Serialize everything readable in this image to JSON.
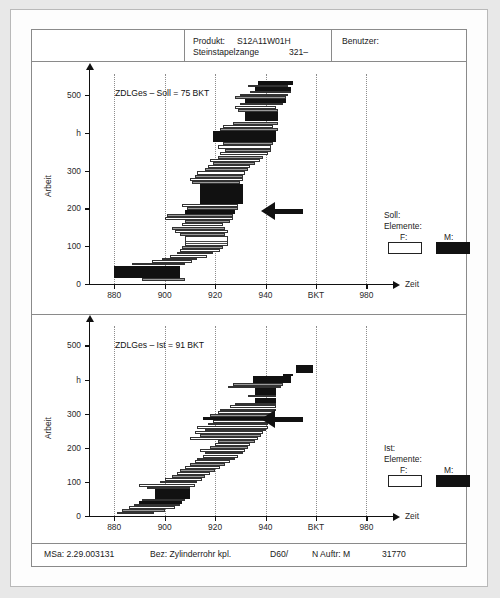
{
  "header": {
    "produkt_label": "Produkt:",
    "produkt_value": "S12A11W01H",
    "produkt_name": "Steinstapelzange",
    "produkt_num": "321–",
    "benutzer_label": "Benutzer:"
  },
  "footer": {
    "msa": "MSa: 2.29.003131",
    "bez": "Bez: Zylinderrohr kpl.",
    "d60": "D60/",
    "nauftr": "N Auftr: M",
    "number": "31770"
  },
  "legend_top": {
    "title": "Soll:",
    "subtitle": "Elemente:",
    "f_label": "F:",
    "m_label": "M:"
  },
  "legend_bottom": {
    "title": "Ist:",
    "subtitle": "Elemente:",
    "f_label": "F:",
    "m_label": "M:"
  },
  "colors": {
    "ink": "#111111",
    "grid": "#8d8d8d",
    "paper": "#ffffff",
    "page_bg": "#e8e8e8"
  },
  "chart_data": [
    {
      "id": "soll",
      "type": "bar",
      "orientation": "horizontal",
      "title": "ZDLGes – Soll = 75 BKT",
      "xlabel": "Zeit",
      "ylabel": "Arbeit",
      "yunit": "h",
      "xlim": [
        870,
        985
      ],
      "ylim": [
        0,
        545
      ],
      "xticks": [
        880,
        900,
        920,
        940,
        960,
        980
      ],
      "xticklabels": [
        "880",
        "900",
        "920",
        "940",
        "BKT",
        "980"
      ],
      "yticks": [
        0,
        100,
        200,
        300,
        400,
        500
      ],
      "yticklabels": [
        "0",
        "100",
        "200",
        "300",
        "h",
        "500"
      ],
      "grid": "vertical-dotted",
      "legend_position": "right-lower",
      "annotation_arrow_y": 193,
      "bars": [
        {
          "y": 8,
          "h": 9,
          "x0": 891,
          "x1": 908,
          "kind": "g"
        },
        {
          "y": 17,
          "h": 23,
          "x0": 880,
          "x1": 906,
          "kind": "m"
        },
        {
          "y": 40,
          "h": 9,
          "x0": 880,
          "x1": 906,
          "kind": "m"
        },
        {
          "y": 49,
          "h": 7,
          "x0": 887,
          "x1": 908,
          "kind": "g"
        },
        {
          "y": 56,
          "h": 7,
          "x0": 895,
          "x1": 911,
          "kind": "f"
        },
        {
          "y": 63,
          "h": 7,
          "x0": 899,
          "x1": 913,
          "kind": "g"
        },
        {
          "y": 70,
          "h": 8,
          "x0": 902,
          "x1": 917,
          "kind": "f"
        },
        {
          "y": 78,
          "h": 7,
          "x0": 905,
          "x1": 919,
          "kind": "g"
        },
        {
          "y": 85,
          "h": 8,
          "x0": 906,
          "x1": 922,
          "kind": "f"
        },
        {
          "y": 93,
          "h": 7,
          "x0": 907,
          "x1": 923,
          "kind": "g"
        },
        {
          "y": 100,
          "h": 27,
          "x0": 908,
          "x1": 925,
          "kind": "h"
        },
        {
          "y": 127,
          "h": 8,
          "x0": 906,
          "x1": 924,
          "kind": "g"
        },
        {
          "y": 135,
          "h": 9,
          "x0": 904,
          "x1": 925,
          "kind": "f"
        },
        {
          "y": 144,
          "h": 8,
          "x0": 903,
          "x1": 924,
          "kind": "g"
        },
        {
          "y": 152,
          "h": 9,
          "x0": 907,
          "x1": 923,
          "kind": "f"
        },
        {
          "y": 161,
          "h": 8,
          "x0": 908,
          "x1": 926,
          "kind": "g"
        },
        {
          "y": 169,
          "h": 9,
          "x0": 900,
          "x1": 927,
          "kind": "f"
        },
        {
          "y": 178,
          "h": 8,
          "x0": 901,
          "x1": 927,
          "kind": "g"
        },
        {
          "y": 186,
          "h": 9,
          "x0": 908,
          "x1": 928,
          "kind": "m"
        },
        {
          "y": 195,
          "h": 8,
          "x0": 909,
          "x1": 929,
          "kind": "g"
        },
        {
          "y": 203,
          "h": 9,
          "x0": 907,
          "x1": 929,
          "kind": "f"
        },
        {
          "y": 212,
          "h": 43,
          "x0": 914,
          "x1": 931,
          "kind": "m"
        },
        {
          "y": 255,
          "h": 9,
          "x0": 914,
          "x1": 931,
          "kind": "m"
        },
        {
          "y": 264,
          "h": 8,
          "x0": 911,
          "x1": 930,
          "kind": "g"
        },
        {
          "y": 272,
          "h": 9,
          "x0": 910,
          "x1": 931,
          "kind": "f"
        },
        {
          "y": 281,
          "h": 8,
          "x0": 912,
          "x1": 931,
          "kind": "g"
        },
        {
          "y": 289,
          "h": 9,
          "x0": 913,
          "x1": 932,
          "kind": "f"
        },
        {
          "y": 298,
          "h": 8,
          "x0": 916,
          "x1": 933,
          "kind": "g"
        },
        {
          "y": 306,
          "h": 9,
          "x0": 917,
          "x1": 934,
          "kind": "f"
        },
        {
          "y": 315,
          "h": 8,
          "x0": 919,
          "x1": 936,
          "kind": "g"
        },
        {
          "y": 323,
          "h": 9,
          "x0": 918,
          "x1": 938,
          "kind": "f"
        },
        {
          "y": 332,
          "h": 8,
          "x0": 921,
          "x1": 939,
          "kind": "g"
        },
        {
          "y": 340,
          "h": 9,
          "x0": 922,
          "x1": 941,
          "kind": "f"
        },
        {
          "y": 349,
          "h": 8,
          "x0": 924,
          "x1": 942,
          "kind": "g"
        },
        {
          "y": 357,
          "h": 10,
          "x0": 921,
          "x1": 942,
          "kind": "f"
        },
        {
          "y": 367,
          "h": 8,
          "x0": 923,
          "x1": 943,
          "kind": "g"
        },
        {
          "y": 375,
          "h": 29,
          "x0": 919,
          "x1": 944,
          "kind": "m"
        },
        {
          "y": 404,
          "h": 8,
          "x0": 922,
          "x1": 945,
          "kind": "g"
        },
        {
          "y": 412,
          "h": 10,
          "x0": 923,
          "x1": 943,
          "kind": "f"
        },
        {
          "y": 422,
          "h": 8,
          "x0": 927,
          "x1": 945,
          "kind": "g"
        },
        {
          "y": 430,
          "h": 25,
          "x0": 932,
          "x1": 945,
          "kind": "m"
        },
        {
          "y": 455,
          "h": 8,
          "x0": 929,
          "x1": 945,
          "kind": "g"
        },
        {
          "y": 463,
          "h": 9,
          "x0": 928,
          "x1": 944,
          "kind": "f"
        },
        {
          "y": 472,
          "h": 7,
          "x0": 930,
          "x1": 947,
          "kind": "g"
        },
        {
          "y": 479,
          "h": 11,
          "x0": 932,
          "x1": 948,
          "kind": "m"
        },
        {
          "y": 490,
          "h": 7,
          "x0": 928,
          "x1": 948,
          "kind": "g"
        },
        {
          "y": 497,
          "h": 7,
          "x0": 930,
          "x1": 949,
          "kind": "f"
        },
        {
          "y": 504,
          "h": 6,
          "x0": 934,
          "x1": 950,
          "kind": "g"
        },
        {
          "y": 510,
          "h": 11,
          "x0": 936,
          "x1": 950,
          "kind": "m"
        },
        {
          "y": 521,
          "h": 6,
          "x0": 933,
          "x1": 949,
          "kind": "g"
        },
        {
          "y": 527,
          "h": 9,
          "x0": 937,
          "x1": 951,
          "kind": "m"
        }
      ]
    },
    {
      "id": "ist",
      "type": "bar",
      "orientation": "horizontal",
      "title": "ZDLGes – Ist = 91 BKT",
      "xlabel": "Zeit",
      "ylabel": "Arbeit",
      "yunit": "h",
      "xlim": [
        870,
        985
      ],
      "ylim": [
        0,
        545
      ],
      "xticks": [
        880,
        900,
        920,
        940,
        960,
        980
      ],
      "xticklabels": [
        "880",
        "900",
        "920",
        "940",
        "BKT",
        "980"
      ],
      "yticks": [
        0,
        100,
        200,
        300,
        400,
        500
      ],
      "yticklabels": [
        "0",
        "100",
        "200",
        "300",
        "h",
        "500"
      ],
      "grid": "vertical-dotted",
      "legend_position": "right-lower",
      "annotation_arrow_y": 283,
      "bars": [
        {
          "y": 5,
          "h": 8,
          "x0": 881,
          "x1": 896,
          "kind": "f"
        },
        {
          "y": 13,
          "h": 7,
          "x0": 883,
          "x1": 900,
          "kind": "g"
        },
        {
          "y": 20,
          "h": 8,
          "x0": 886,
          "x1": 904,
          "kind": "f"
        },
        {
          "y": 28,
          "h": 7,
          "x0": 888,
          "x1": 906,
          "kind": "g"
        },
        {
          "y": 35,
          "h": 9,
          "x0": 890,
          "x1": 907,
          "kind": "m"
        },
        {
          "y": 44,
          "h": 7,
          "x0": 891,
          "x1": 908,
          "kind": "g"
        },
        {
          "y": 51,
          "h": 28,
          "x0": 896,
          "x1": 910,
          "kind": "m"
        },
        {
          "y": 79,
          "h": 7,
          "x0": 893,
          "x1": 910,
          "kind": "g"
        },
        {
          "y": 86,
          "h": 9,
          "x0": 890,
          "x1": 912,
          "kind": "f"
        },
        {
          "y": 95,
          "h": 8,
          "x0": 898,
          "x1": 913,
          "kind": "g"
        },
        {
          "y": 103,
          "h": 9,
          "x0": 900,
          "x1": 915,
          "kind": "f"
        },
        {
          "y": 112,
          "h": 8,
          "x0": 903,
          "x1": 916,
          "kind": "g"
        },
        {
          "y": 120,
          "h": 9,
          "x0": 905,
          "x1": 918,
          "kind": "f"
        },
        {
          "y": 129,
          "h": 8,
          "x0": 906,
          "x1": 920,
          "kind": "g"
        },
        {
          "y": 137,
          "h": 9,
          "x0": 908,
          "x1": 922,
          "kind": "f"
        },
        {
          "y": 146,
          "h": 8,
          "x0": 910,
          "x1": 924,
          "kind": "g"
        },
        {
          "y": 154,
          "h": 9,
          "x0": 912,
          "x1": 926,
          "kind": "f"
        },
        {
          "y": 163,
          "h": 8,
          "x0": 913,
          "x1": 928,
          "kind": "g"
        },
        {
          "y": 171,
          "h": 9,
          "x0": 915,
          "x1": 929,
          "kind": "f"
        },
        {
          "y": 180,
          "h": 8,
          "x0": 916,
          "x1": 931,
          "kind": "g"
        },
        {
          "y": 188,
          "h": 9,
          "x0": 914,
          "x1": 932,
          "kind": "f"
        },
        {
          "y": 197,
          "h": 8,
          "x0": 918,
          "x1": 933,
          "kind": "g"
        },
        {
          "y": 205,
          "h": 9,
          "x0": 920,
          "x1": 934,
          "kind": "f"
        },
        {
          "y": 214,
          "h": 8,
          "x0": 921,
          "x1": 936,
          "kind": "g"
        },
        {
          "y": 222,
          "h": 9,
          "x0": 910,
          "x1": 937,
          "kind": "f"
        },
        {
          "y": 231,
          "h": 8,
          "x0": 914,
          "x1": 938,
          "kind": "g"
        },
        {
          "y": 239,
          "h": 9,
          "x0": 912,
          "x1": 939,
          "kind": "f"
        },
        {
          "y": 248,
          "h": 8,
          "x0": 916,
          "x1": 940,
          "kind": "g"
        },
        {
          "y": 256,
          "h": 9,
          "x0": 913,
          "x1": 941,
          "kind": "f"
        },
        {
          "y": 265,
          "h": 8,
          "x0": 917,
          "x1": 941,
          "kind": "g"
        },
        {
          "y": 273,
          "h": 9,
          "x0": 919,
          "x1": 942,
          "kind": "f"
        },
        {
          "y": 282,
          "h": 9,
          "x0": 915,
          "x1": 943,
          "kind": "m"
        },
        {
          "y": 291,
          "h": 8,
          "x0": 918,
          "x1": 943,
          "kind": "g"
        },
        {
          "y": 299,
          "h": 9,
          "x0": 921,
          "x1": 943,
          "kind": "f"
        },
        {
          "y": 308,
          "h": 7,
          "x0": 922,
          "x1": 944,
          "kind": "g"
        },
        {
          "y": 315,
          "h": 9,
          "x0": 926,
          "x1": 944,
          "kind": "f"
        },
        {
          "y": 324,
          "h": 7,
          "x0": 928,
          "x1": 944,
          "kind": "g"
        },
        {
          "y": 331,
          "h": 16,
          "x0": 936,
          "x1": 944,
          "kind": "m"
        },
        {
          "y": 347,
          "h": 8,
          "x0": 933,
          "x1": 944,
          "kind": "g"
        },
        {
          "y": 355,
          "h": 20,
          "x0": 936,
          "x1": 944,
          "kind": "m"
        },
        {
          "y": 375,
          "h": 7,
          "x0": 925,
          "x1": 946,
          "kind": "g"
        },
        {
          "y": 382,
          "h": 7,
          "x0": 927,
          "x1": 947,
          "kind": "g"
        },
        {
          "y": 389,
          "h": 22,
          "x0": 935,
          "x1": 950,
          "kind": "m"
        },
        {
          "y": 411,
          "h": 4,
          "x0": 947,
          "x1": 951,
          "kind": "m"
        },
        {
          "y": 420,
          "h": 22,
          "x0": 952,
          "x1": 959,
          "kind": "m"
        }
      ]
    }
  ]
}
